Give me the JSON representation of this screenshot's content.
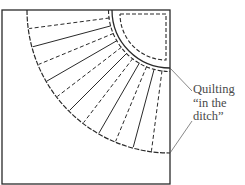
{
  "diagram": {
    "type": "quilt-block-fan",
    "annotation": {
      "lines": [
        "Quilting",
        "“in the",
        "ditch”"
      ]
    },
    "frame": {
      "x": 2,
      "y": 10,
      "w": 168,
      "h": 174
    },
    "fan": {
      "center": [
        170,
        10
      ],
      "inner_radius": 58,
      "outer_radius": 143,
      "radial_lines": 11,
      "pattern": [
        "dashed",
        "solid",
        "dashed",
        "solid",
        "dashed",
        "solid",
        "dashed",
        "solid",
        "dashed",
        "solid",
        "dashed"
      ]
    },
    "colors": {
      "line": "#2a2a2a",
      "text": "#4a4a4a",
      "leader": "#555555"
    }
  }
}
